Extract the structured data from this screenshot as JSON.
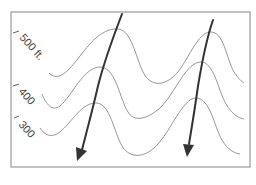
{
  "diagram": {
    "type": "topographic-contour-map",
    "contours": [
      {
        "label": "500 ft.",
        "elevation": 500
      },
      {
        "label": "400",
        "elevation": 400
      },
      {
        "label": "300",
        "elevation": 300
      }
    ],
    "arrows": [
      {
        "name": "flow-arrow-left",
        "direction": "downslope"
      },
      {
        "name": "flow-arrow-right",
        "direction": "downslope"
      }
    ],
    "colors": {
      "frame": "#9a9a9a",
      "contour": "#8a8a8a",
      "arrow": "#333333",
      "label": "#444444"
    }
  }
}
